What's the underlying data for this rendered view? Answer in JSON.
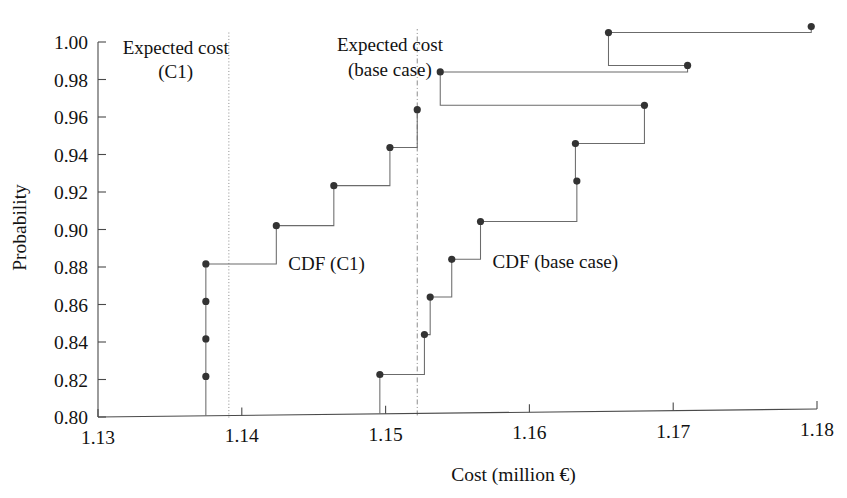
{
  "chart_data": {
    "type": "line",
    "subtype": "step-cdf",
    "title": "",
    "xlabel": "Cost (million €)",
    "ylabel": "Probability",
    "xlim": [
      1.13,
      1.18
    ],
    "ylim": [
      0.8,
      1.0
    ],
    "xticks": [
      "1.13",
      "1.14",
      "1.15",
      "1.16",
      "1.17",
      "1.18"
    ],
    "xtick_values": [
      1.13,
      1.14,
      1.15,
      1.16,
      1.17,
      1.18
    ],
    "yticks": [
      "0.80",
      "0.82",
      "0.84",
      "0.86",
      "0.88",
      "0.90",
      "0.92",
      "0.94",
      "0.96",
      "0.98",
      "1.00"
    ],
    "ytick_values": [
      0.8,
      0.82,
      0.84,
      0.86,
      0.88,
      0.9,
      0.92,
      0.94,
      0.96,
      0.98,
      1.0
    ],
    "grid": false,
    "legend_position": "inline-annotations",
    "series": [
      {
        "name": "CDF (C1)",
        "label": "CDF (C1)",
        "style": "step-post",
        "marker": "filled-circle",
        "color": "#333333",
        "points": [
          {
            "x": 1.1375,
            "y": 0.821
          },
          {
            "x": 1.1375,
            "y": 0.841
          },
          {
            "x": 1.1375,
            "y": 0.861
          },
          {
            "x": 1.1375,
            "y": 0.881
          },
          {
            "x": 1.1424,
            "y": 0.901
          },
          {
            "x": 1.1464,
            "y": 0.922
          },
          {
            "x": 1.1503,
            "y": 0.942
          },
          {
            "x": 1.1522,
            "y": 0.962
          }
        ]
      },
      {
        "name": "CDF (base case)",
        "label": "CDF (base case)",
        "style": "step-post",
        "marker": "filled-circle",
        "color": "#333333",
        "points": [
          {
            "x": 1.1496,
            "y": 0.821
          },
          {
            "x": 1.1527,
            "y": 0.842
          },
          {
            "x": 1.1531,
            "y": 0.862
          },
          {
            "x": 1.1546,
            "y": 0.882
          },
          {
            "x": 1.1566,
            "y": 0.902
          },
          {
            "x": 1.1633,
            "y": 0.923
          },
          {
            "x": 1.1632,
            "y": 0.943
          },
          {
            "x": 1.168,
            "y": 0.963
          },
          {
            "x": 1.1538,
            "y": 0.982
          },
          {
            "x": 1.171,
            "y": 0.984
          },
          {
            "x": 1.1655,
            "y": 1.002
          },
          {
            "x": 1.1796,
            "y": 1.004
          }
        ]
      }
    ],
    "reference_lines": [
      {
        "name": "expected-cost-c1",
        "label_line1": "Expected cost",
        "label_line2": "(C1)",
        "x": 1.1391,
        "style": "dotted",
        "orientation": "vertical"
      },
      {
        "name": "expected-cost-base-case",
        "label_line1": "Expected cost",
        "label_line2": "(base case)",
        "x": 1.1522,
        "style": "dash-dot",
        "orientation": "vertical"
      }
    ],
    "annotations": [
      {
        "name": "cdf-c1-label",
        "text": "CDF (C1)",
        "x": 1.1459,
        "y": 0.88
      },
      {
        "name": "cdf-base-case-label",
        "text": "CDF (base case)",
        "x": 1.1618,
        "y": 0.88
      },
      {
        "name": "expected-cost-c1-label-1",
        "text": "Expected cost",
        "x": 1.1354,
        "y": 0.9965
      },
      {
        "name": "expected-cost-c1-label-2",
        "text": "(C1)",
        "x": 1.1354,
        "y": 0.9835
      },
      {
        "name": "expected-cost-base-label-1",
        "text": "Expected cost",
        "x": 1.1503,
        "y": 0.9965
      },
      {
        "name": "expected-cost-base-label-2",
        "text": "(base case)",
        "x": 1.1503,
        "y": 0.9835
      }
    ]
  },
  "colors": {
    "axis": "#4a4a4a",
    "marker": "#333333",
    "step": "#6b6b6b",
    "reference": "#8c8c8c",
    "text": "#121212",
    "background": "#ffffff"
  }
}
